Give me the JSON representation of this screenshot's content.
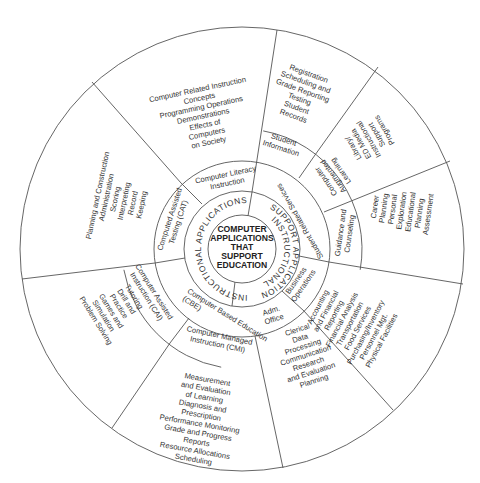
{
  "diagram": {
    "title": "Computer Applications That Support Education",
    "center": {
      "lines": [
        "COMPUTER",
        "APPLICATIONS",
        "THAT",
        "SUPPORT",
        "EDUCATION"
      ]
    },
    "ring2": {
      "left": "INSTRUCTIONAL APPLICATIONS",
      "right_line1": "INSTRUCTIONAL",
      "right_line2": "SUPPORT APPLICATION"
    },
    "ring3": {
      "computer_literacy": [
        "Computer Literacy",
        "Instruction"
      ],
      "cat": [
        "Computed Assisted",
        "Testing (CAT)"
      ],
      "cbe": [
        "Computer Based Education",
        "(CBE)"
      ],
      "student_related_services": "Student Related Services",
      "business_operations": [
        "Business",
        "Operations"
      ],
      "adm_office": [
        "Adm.",
        "Office"
      ]
    },
    "ring4": {
      "cai": [
        "Computer Assisted",
        "Instruction (CAI)"
      ],
      "cmi": [
        "Computer Managed",
        "Instruction (CMI)"
      ],
      "student_information": [
        "Student",
        "Information"
      ],
      "computer_augmented_learning": [
        "Computer",
        "Augmented",
        "Learning"
      ],
      "guidance_counseling": [
        "Guidance and",
        "Counseling"
      ]
    },
    "outer": {
      "computer_literacy_detail": [
        "Computer Related Instruction",
        "Concepts",
        "Programming Operations",
        "Demonstrations",
        "Effects of",
        "Computers",
        "on Society"
      ],
      "cat_detail": [
        "Planning and Construction",
        "Administration",
        "Scoring",
        "Interpreting",
        "Record",
        "Keeping"
      ],
      "cai_detail": [
        "Tutoring",
        "Drill and",
        "Practice",
        "Games and",
        "Simulation",
        "Problem Solving"
      ],
      "cmi_detail": [
        "Measurement",
        "and Evaluation",
        "of Learning",
        "Diagnosis and",
        "Prescription",
        "Performance Monitoring",
        "Grade and Progress",
        "Reports",
        "Resource Allocations",
        "Scheduling"
      ],
      "adm_office_detail": [
        "Clerical",
        "Data",
        "Processing",
        "Communication",
        "Research",
        "and Evaluation",
        "Planning"
      ],
      "business_detail": [
        "Accounting",
        "and Financial",
        "Reporting",
        "Financial Analysis",
        "Transportation",
        "Food Services",
        "Purchasing/Inventory",
        "Personnel Mgt.",
        "Physical Facilities"
      ],
      "guidance_detail": [
        "Career",
        "Planning",
        "Personal",
        "Exploration",
        "Educational",
        "Planning",
        "Assessment"
      ],
      "augmented_detail": [
        "Library/",
        "ED Media",
        "Instructional",
        "Support",
        "Programs"
      ],
      "student_info_detail": [
        "Registration",
        "Scheduling and",
        "Grade Reporting",
        "Testing",
        "Student",
        "Records"
      ]
    }
  }
}
